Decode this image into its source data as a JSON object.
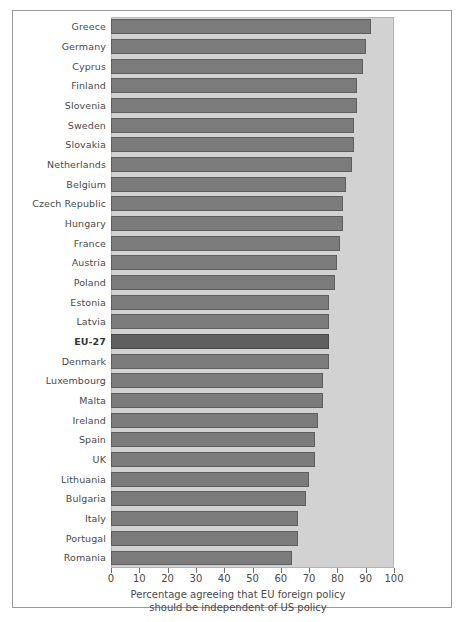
{
  "chart_data": {
    "type": "bar",
    "orientation": "horizontal",
    "title": "",
    "xlabel": "Percentage agreeing that EU foreign policy should be independent of US policy",
    "ylabel": "",
    "xlim": [
      0,
      100
    ],
    "xticks": [
      0,
      10,
      20,
      30,
      40,
      50,
      60,
      70,
      80,
      90,
      100
    ],
    "grid": false,
    "legend": null,
    "highlight_category": "EU-27",
    "categories": [
      "Greece",
      "Germany",
      "Cyprus",
      "Finland",
      "Slovenia",
      "Sweden",
      "Slovakia",
      "Netherlands",
      "Belgium",
      "Czech Republic",
      "Hungary",
      "France",
      "Austria",
      "Poland",
      "Estonia",
      "Latvia",
      "EU-27",
      "Denmark",
      "Luxembourg",
      "Malta",
      "Ireland",
      "Spain",
      "UK",
      "Lithuania",
      "Bulgaria",
      "Italy",
      "Portugal",
      "Romania"
    ],
    "values": [
      92,
      90,
      89,
      87,
      87,
      86,
      86,
      85,
      83,
      82,
      82,
      81,
      80,
      79,
      77,
      77,
      77,
      77,
      75,
      75,
      73,
      72,
      72,
      70,
      69,
      66,
      66,
      64
    ]
  },
  "caption": {
    "line1": "Percentage agreeing that EU foreign policy",
    "line2": "should be independent of US policy"
  },
  "colors": {
    "bar_fill": "#7b7b7b",
    "bar_edge": "#5e5e5e",
    "highlight_fill": "#5f5f5f",
    "highlight_edge": "#494949",
    "plot_background": "#d2d2d2",
    "figure_background": "#ffffff",
    "frame": "#9a9a9a",
    "text": "#4a4a4a"
  }
}
